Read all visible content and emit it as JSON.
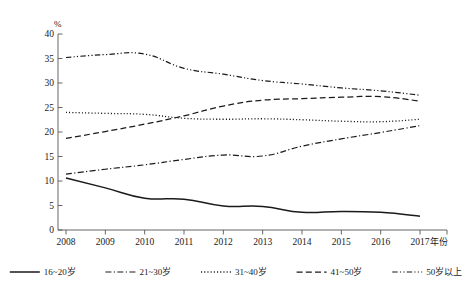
{
  "chart_data": {
    "type": "line",
    "title": "",
    "subtitle": "",
    "xlabel": "年份",
    "ylabel": "%",
    "x": [
      2008,
      2009,
      2010,
      2011,
      2012,
      2013,
      2014,
      2015,
      2016,
      2017
    ],
    "categories": [
      "2008",
      "2009",
      "2010",
      "2011",
      "2012",
      "2013",
      "2014",
      "2015",
      "2016",
      "2017"
    ],
    "xlim": [
      2008,
      2017
    ],
    "ylim": [
      0,
      40
    ],
    "yticks": [
      0,
      5,
      10,
      15,
      20,
      25,
      30,
      35,
      40
    ],
    "ytick_labels": [
      "0",
      "5",
      "10",
      "15",
      "20",
      "25",
      "30",
      "35",
      "40"
    ],
    "grid": false,
    "legend_position": "bottom",
    "series": [
      {
        "name": "16~20岁",
        "line_style": "solid",
        "color": "#1a1a1a",
        "values": [
          10.6,
          8.6,
          6.5,
          6.3,
          4.9,
          4.8,
          3.6,
          3.8,
          3.6,
          2.8
        ]
      },
      {
        "name": "21~30岁",
        "line_style": "dash-dot",
        "color": "#1a1a1a",
        "values": [
          11.4,
          12.4,
          13.3,
          14.4,
          15.3,
          15.1,
          17.1,
          18.6,
          19.9,
          21.3
        ]
      },
      {
        "name": "31~40岁",
        "line_style": "dotted",
        "color": "#1a1a1a",
        "values": [
          24.0,
          23.8,
          23.6,
          22.8,
          22.6,
          22.7,
          22.5,
          22.2,
          22.1,
          22.6
        ]
      },
      {
        "name": "41~50岁",
        "line_style": "dashed",
        "color": "#1a1a1a",
        "values": [
          18.7,
          20.1,
          21.6,
          23.3,
          25.3,
          26.5,
          26.8,
          27.1,
          27.2,
          26.3
        ]
      },
      {
        "name": "50岁以上",
        "line_style": "dash-dot-dot",
        "color": "#1a1a1a",
        "values": [
          35.2,
          35.8,
          35.9,
          33.0,
          31.8,
          30.5,
          29.8,
          29.0,
          28.4,
          27.5
        ]
      }
    ]
  },
  "axes": {
    "y_axis_unit_label": "%",
    "x_axis_name_label": "年份"
  }
}
